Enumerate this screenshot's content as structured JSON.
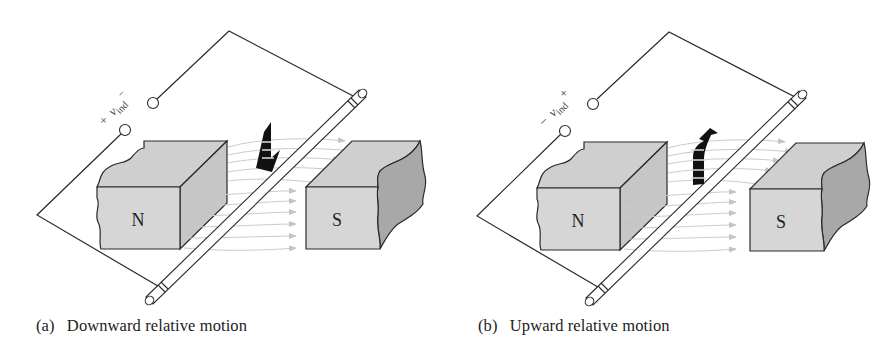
{
  "figure": {
    "panels": [
      {
        "id": "a",
        "tag": "(a)",
        "caption": "Downward relative motion",
        "motion": "down",
        "voltage_label": {
          "sign_left": "+",
          "symbol": "v",
          "subscript": "ind",
          "sign_right": "−"
        },
        "magnets": {
          "left": "N",
          "right": "S"
        }
      },
      {
        "id": "b",
        "tag": "(b)",
        "caption": "Upward relative motion",
        "motion": "up",
        "voltage_label": {
          "sign_left": "−",
          "symbol": "v",
          "subscript": "ind",
          "sign_right": "+"
        },
        "magnets": {
          "left": "N",
          "right": "S"
        }
      }
    ],
    "colors": {
      "line": "#2a2a2a",
      "magnet_face": "#d4d4d4",
      "magnet_top": "#c9c9c9",
      "magnet_side": "#bdbdbd",
      "magnet_broken": "#a9a9a9",
      "field_lines": "#c8c8c8",
      "arrow": "#111111"
    }
  }
}
